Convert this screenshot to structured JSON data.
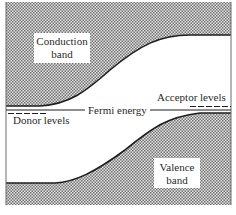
{
  "diagram": {
    "labels": {
      "conduction_line1": "Conduction",
      "conduction_line2": "band",
      "valence_line1": "Valence",
      "valence_line2": "band",
      "fermi": "Fermi energy",
      "donor": "Donor levels",
      "acceptor": "Acceptor levels"
    },
    "colors": {
      "line": "#1e1e1e",
      "hatch_dark": "#6e6e6e",
      "hatch_light": "#e8e8e8",
      "background": "#ffffff"
    }
  }
}
